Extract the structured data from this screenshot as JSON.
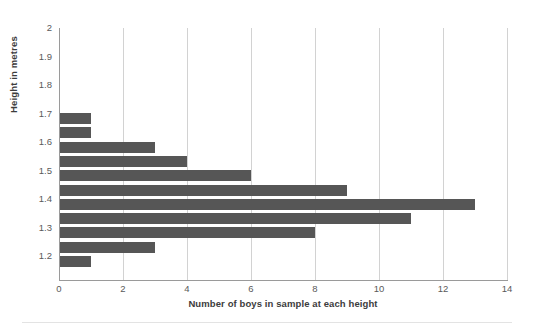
{
  "chart_data": {
    "type": "bar",
    "orientation": "horizontal",
    "title": "",
    "subtitle": "",
    "xlabel": "Number of boys in sample at each height",
    "ylabel": "Height in metres",
    "xlim": [
      0,
      14
    ],
    "ylim": [
      1.15,
      2.0
    ],
    "grid": "vertical",
    "legend": "none",
    "bar_color": "#565656",
    "gridline_color": "#d2d2d2",
    "axis_color": "#9a9a9a",
    "x_ticks": [
      "0",
      "2",
      "4",
      "6",
      "8",
      "10",
      "12",
      "14"
    ],
    "x_tick_values": [
      0,
      2,
      4,
      6,
      8,
      10,
      12,
      14
    ],
    "y_ticks": [
      "2",
      "1.9",
      "1.8",
      "1.7",
      "1.6",
      "1.5",
      "1.4",
      "1.3",
      "1.2"
    ],
    "y_tick_values": [
      2.0,
      1.9,
      1.8,
      1.7,
      1.6,
      1.5,
      1.4,
      1.3,
      1.2
    ],
    "categories": [
      "1.70",
      "1.65",
      "1.60",
      "1.55",
      "1.50",
      "1.45",
      "1.40",
      "1.35",
      "1.30",
      "1.25",
      "1.20"
    ],
    "values": [
      1,
      1,
      3,
      4,
      6,
      9,
      13,
      11,
      8,
      3,
      1
    ],
    "bars": [
      {
        "category": "1.70",
        "bin_start": 1.7,
        "value": 1
      },
      {
        "category": "1.65",
        "bin_start": 1.65,
        "value": 1
      },
      {
        "category": "1.60",
        "bin_start": 1.6,
        "value": 3
      },
      {
        "category": "1.55",
        "bin_start": 1.55,
        "value": 4
      },
      {
        "category": "1.50",
        "bin_start": 1.5,
        "value": 6
      },
      {
        "category": "1.45",
        "bin_start": 1.45,
        "value": 9
      },
      {
        "category": "1.40",
        "bin_start": 1.4,
        "value": 13
      },
      {
        "category": "1.35",
        "bin_start": 1.35,
        "value": 11
      },
      {
        "category": "1.30",
        "bin_start": 1.3,
        "value": 8
      },
      {
        "category": "1.25",
        "bin_start": 1.25,
        "value": 3
      },
      {
        "category": "1.20",
        "bin_start": 1.2,
        "value": 1
      }
    ]
  }
}
